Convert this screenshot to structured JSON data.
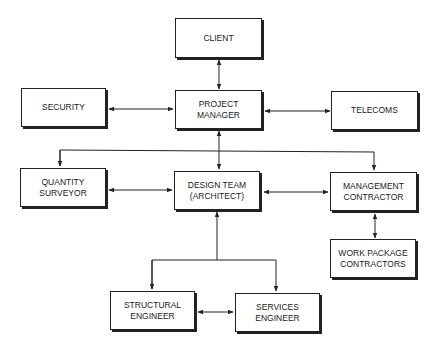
{
  "diagram": {
    "type": "organizational-flow",
    "nodes": {
      "client": {
        "line1": "CLIENT",
        "line2": ""
      },
      "project_manager": {
        "line1": "PROJECT",
        "line2": "MANAGER"
      },
      "security": {
        "line1": "SECURITY",
        "line2": ""
      },
      "telecoms": {
        "line1": "TELECOMS",
        "line2": ""
      },
      "quantity_surveyor": {
        "line1": "QUANTITY",
        "line2": "SURVEYOR"
      },
      "design_team": {
        "line1": "DESIGN TEAM",
        "line2": "(ARCHITECT)"
      },
      "management_contractor": {
        "line1": "MANAGEMENT",
        "line2": "CONTRACTOR"
      },
      "work_package_contractors": {
        "line1": "WORK PACKAGE",
        "line2": "CONTRACTORS"
      },
      "structural_engineer": {
        "line1": "STRUCTURAL",
        "line2": "ENGINEER"
      },
      "services_engineer": {
        "line1": "SERVICES",
        "line2": "ENGINEER"
      }
    },
    "edges": [
      {
        "from": "client",
        "to": "project_manager",
        "type": "bidirectional"
      },
      {
        "from": "security",
        "to": "project_manager",
        "type": "bidirectional"
      },
      {
        "from": "project_manager",
        "to": "telecoms",
        "type": "bidirectional"
      },
      {
        "from": "project_manager",
        "to": "design_team",
        "type": "bidirectional"
      },
      {
        "from": "project_manager",
        "to": "quantity_surveyor",
        "type": "directed"
      },
      {
        "from": "project_manager",
        "to": "management_contractor",
        "type": "directed"
      },
      {
        "from": "quantity_surveyor",
        "to": "design_team",
        "type": "bidirectional"
      },
      {
        "from": "design_team",
        "to": "management_contractor",
        "type": "bidirectional"
      },
      {
        "from": "management_contractor",
        "to": "work_package_contractors",
        "type": "bidirectional"
      },
      {
        "from": "structural_engineer",
        "to": "design_team",
        "type": "directed-up"
      },
      {
        "from": "design_team",
        "to": "structural_engineer",
        "type": "directed"
      },
      {
        "from": "design_team",
        "to": "services_engineer",
        "type": "directed"
      },
      {
        "from": "structural_engineer",
        "to": "services_engineer",
        "type": "bidirectional"
      }
    ]
  },
  "colors": {
    "line": "#222222",
    "background": "#ffffff"
  }
}
